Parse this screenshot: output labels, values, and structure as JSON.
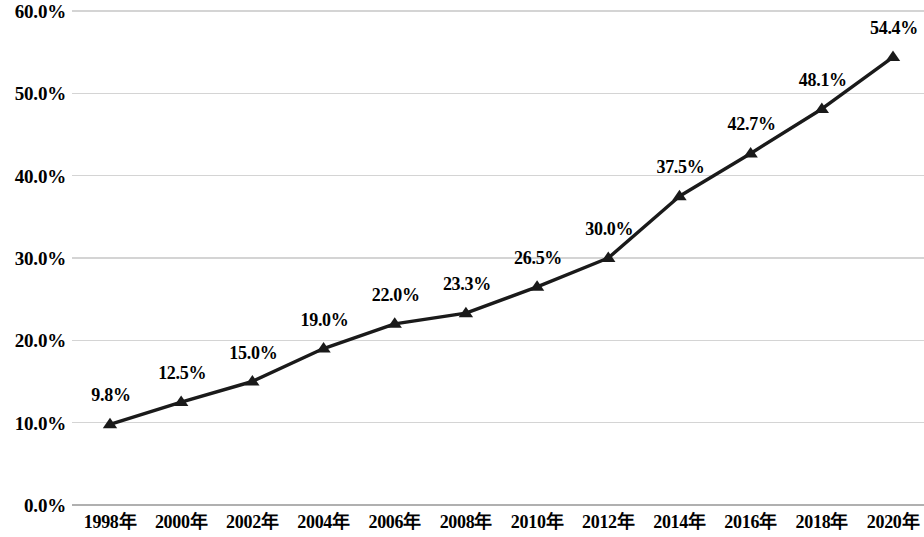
{
  "chart_data": {
    "type": "line",
    "title": "",
    "subtitle": "",
    "xlabel": "",
    "ylabel": "",
    "categories": [
      "1998年",
      "2000年",
      "2002年",
      "2004年",
      "2006年",
      "2008年",
      "2010年",
      "2012年",
      "2014年",
      "2016年",
      "2018年",
      "2020年"
    ],
    "values": [
      9.8,
      12.5,
      15.0,
      19.0,
      22.0,
      23.3,
      26.5,
      30.0,
      37.5,
      42.7,
      48.1,
      54.4
    ],
    "point_labels": [
      "9.8%",
      "12.5%",
      "15.0%",
      "19.0%",
      "22.0%",
      "23.3%",
      "26.5%",
      "30.0%",
      "37.5%",
      "42.7%",
      "48.1%",
      "54.4%"
    ],
    "ylim": [
      0,
      60
    ],
    "ytick_values": [
      60,
      50,
      40,
      30,
      20,
      10,
      0
    ],
    "ytick_labels": [
      "60.0%",
      "50.0%",
      "40.0%",
      "30.0%",
      "20.0%",
      "10.0%",
      "0.0%"
    ],
    "grid": true,
    "legend": "none",
    "series": [
      {
        "name": "",
        "marker": "triangle",
        "line_color": "#1a1a1a",
        "marker_color": "#1a1a1a",
        "values": [
          9.8,
          12.5,
          15.0,
          19.0,
          22.0,
          23.3,
          26.5,
          30.0,
          37.5,
          42.7,
          48.1,
          54.4
        ]
      }
    ],
    "colors": {
      "line": "#1a1a1a",
      "marker": "#1a1a1a",
      "gridline": "#d4d4d4",
      "axis": "#b0b0b0",
      "text": "#000000",
      "background": "#ffffff"
    }
  }
}
